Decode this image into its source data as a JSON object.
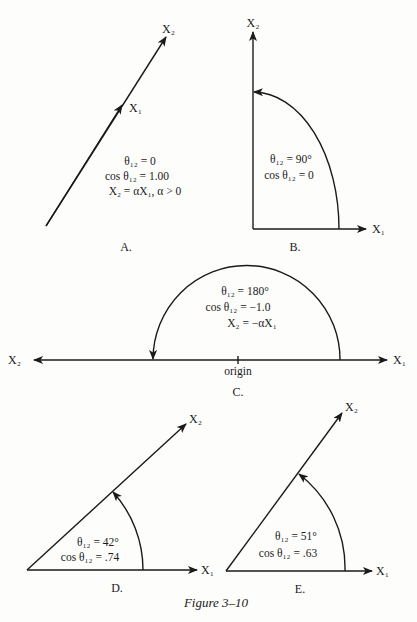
{
  "figure": {
    "caption": "Figure 3–10",
    "panels": [
      {
        "id": "A",
        "label": "A.",
        "vec_top": "X₂",
        "vec_mid": "X₁",
        "lines": [
          "θ₁₂ = 0",
          "cos θ₁₂ = 1.00",
          "X₂ = αX₁, α > 0"
        ]
      },
      {
        "id": "B",
        "label": "B.",
        "x2": "X₂",
        "x1": "X₁",
        "lines": [
          "θ₁₂ = 90°",
          "cos θ₁₂ = 0"
        ]
      },
      {
        "id": "C",
        "label": "C.",
        "x2": "X₂",
        "x1": "X₁",
        "origin": "origin",
        "lines": [
          "θ₁₂ = 180°",
          "cos θ₁₂ = −1.0",
          "X₂ = −αX₁"
        ]
      },
      {
        "id": "D",
        "label": "D.",
        "x2": "X₂",
        "x1": "X₁",
        "lines": [
          "θ₁₂ = 42°",
          "cos θ₁₂ = .74"
        ]
      },
      {
        "id": "E",
        "label": "E.",
        "x2": "X₂",
        "x1": "X₁",
        "lines": [
          "θ₁₂ = 51°",
          "cos θ₁₂ = .63"
        ]
      }
    ]
  }
}
